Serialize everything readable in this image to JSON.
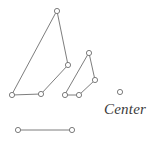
{
  "diagram": {
    "type": "point-and-line-figure",
    "background_color": "#ffffff",
    "line_color": "#6e6e6e",
    "node_fill_color": "#ffffff",
    "node_radius": 2.6,
    "label_color": "#3a3a3a",
    "canvas": {
      "width": 149,
      "height": 144
    },
    "shapes": [
      {
        "name": "large-polygon",
        "closed": true,
        "vertices": [
          {
            "id": "L1",
            "x": 57,
            "y": 11
          },
          {
            "id": "L2",
            "x": 68,
            "y": 65
          },
          {
            "id": "L3",
            "x": 41,
            "y": 94
          },
          {
            "id": "L4",
            "x": 12,
            "y": 95
          }
        ]
      },
      {
        "name": "small-polygon",
        "closed": true,
        "vertices": [
          {
            "id": "S1",
            "x": 89,
            "y": 53
          },
          {
            "id": "S2",
            "x": 95,
            "y": 80
          },
          {
            "id": "S3",
            "x": 79,
            "y": 95
          },
          {
            "id": "S4",
            "x": 65,
            "y": 95
          }
        ]
      },
      {
        "name": "bottom-segment",
        "closed": false,
        "vertices": [
          {
            "id": "B1",
            "x": 18,
            "y": 130
          },
          {
            "id": "B2",
            "x": 72,
            "y": 130
          }
        ]
      }
    ],
    "isolated_points": [
      {
        "id": "C1",
        "name": "center-point",
        "x": 120,
        "y": 92
      }
    ],
    "labels": [
      {
        "id": "center-text",
        "text": "Center",
        "x": 104,
        "y": 102
      }
    ]
  }
}
